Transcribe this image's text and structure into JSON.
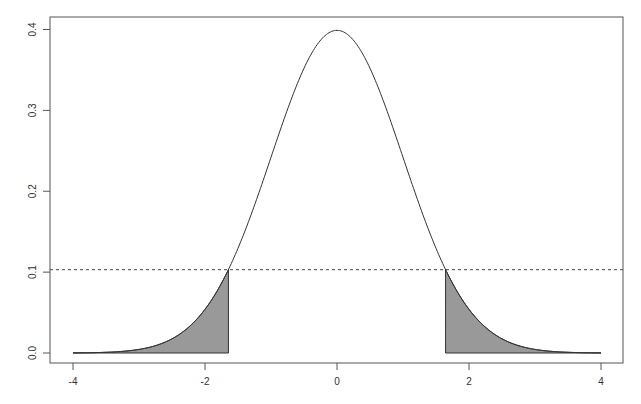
{
  "chart_data": {
    "type": "area",
    "title": "",
    "xlabel": "",
    "ylabel": "",
    "xlim": [
      -4,
      4
    ],
    "ylim": [
      0,
      0.4
    ],
    "grid": false,
    "legend": null,
    "x_ticks": [
      -4,
      -2,
      0,
      2,
      4
    ],
    "x_tick_labels": [
      "-4",
      "-2",
      "0",
      "2",
      "4"
    ],
    "y_ticks": [
      0.0,
      0.1,
      0.2,
      0.3,
      0.4
    ],
    "y_tick_labels": [
      "0.0",
      "0.1",
      "0.2",
      "0.3",
      "0.4"
    ],
    "series": [
      {
        "name": "standard normal density",
        "function": "dnorm(x)",
        "x": [
          -4,
          -3.5,
          -3,
          -2.5,
          -2,
          -1.645,
          -1.5,
          -1,
          -0.5,
          0,
          0.5,
          1,
          1.5,
          1.645,
          2,
          2.5,
          3,
          3.5,
          4
        ],
        "values": [
          0.0001,
          0.0009,
          0.0044,
          0.0175,
          0.054,
          0.103,
          0.1295,
          0.242,
          0.352,
          0.399,
          0.352,
          0.242,
          0.1295,
          0.103,
          0.054,
          0.0175,
          0.0044,
          0.0009,
          0.0001
        ],
        "color": "#333333"
      }
    ],
    "shaded_regions": [
      {
        "from": -4,
        "to": -1.645,
        "fill": "#999999"
      },
      {
        "from": 1.645,
        "to": 4,
        "fill": "#999999"
      }
    ],
    "reference_lines": [
      {
        "orientation": "horizontal",
        "y": 0.103,
        "style": "dashed",
        "color": "#444444"
      }
    ]
  }
}
